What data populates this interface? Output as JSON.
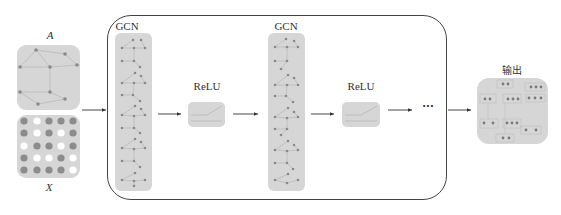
{
  "diagram": {
    "inputs": {
      "adjacency_label": "A",
      "features_label": "X",
      "feature_grid": [
        [
          1,
          0,
          1,
          1,
          1
        ],
        [
          1,
          0,
          1,
          0,
          1
        ],
        [
          0,
          1,
          1,
          0,
          1
        ],
        [
          1,
          0,
          0,
          1,
          0
        ],
        [
          1,
          1,
          1,
          1,
          0
        ]
      ]
    },
    "layers": [
      {
        "type": "gcn",
        "label": "GCN"
      },
      {
        "type": "activation",
        "label": "ReLU"
      },
      {
        "type": "gcn",
        "label": "GCN"
      },
      {
        "type": "activation",
        "label": "ReLU"
      }
    ],
    "continuation": "···",
    "output": {
      "label": "输出"
    },
    "colors": {
      "box_fill": "#d6d6d6",
      "node": "#8a8a8a",
      "edge": "#b0b0b0",
      "frame": "#444444",
      "arrow": "#333333",
      "white_cell": "#ffffff",
      "filled_cell": "#8c8c8c"
    }
  }
}
